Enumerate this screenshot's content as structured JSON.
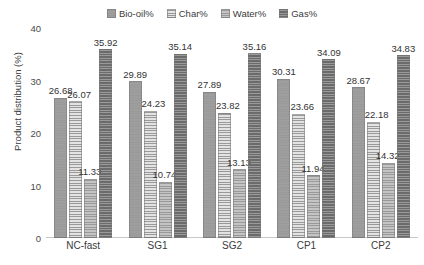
{
  "chart_data": {
    "type": "bar",
    "title": "",
    "xlabel": "",
    "ylabel": "Product distribution (%)",
    "ylim": [
      0,
      40
    ],
    "yticks": [
      "0",
      "10",
      "20",
      "30",
      "40"
    ],
    "grid": false,
    "legend_position": "top-center",
    "categories": [
      "NC-fast",
      "SG1",
      "SG2",
      "CP1",
      "CP2"
    ],
    "series": [
      {
        "name": "Bio-oil%",
        "color": "#9e9e9e",
        "values": [
          26.68,
          29.89,
          27.89,
          30.31,
          28.67
        ],
        "labels": [
          "26.68",
          "29.89",
          "27.89",
          "30.31",
          "28.67"
        ]
      },
      {
        "name": "Char%",
        "color": "#e3e3e3",
        "values": [
          26.07,
          24.23,
          23.82,
          23.66,
          22.18
        ],
        "labels": [
          "26.07",
          "24.23",
          "23.82",
          "23.66",
          "22.18"
        ]
      },
      {
        "name": "Water%",
        "color": "#c4c4c4",
        "values": [
          11.33,
          10.74,
          13.13,
          11.94,
          14.32
        ],
        "labels": [
          "11.33",
          "10.74",
          "13.13",
          "11.94",
          "14.32"
        ]
      },
      {
        "name": "Gas%",
        "color": "#6b6b6b",
        "values": [
          35.92,
          35.14,
          35.16,
          34.09,
          34.83
        ],
        "labels": [
          "35.92",
          "35.14",
          "35.16",
          "34.09",
          "34.83"
        ]
      }
    ]
  },
  "axis": {
    "y_title": "Product distribution (%)"
  }
}
